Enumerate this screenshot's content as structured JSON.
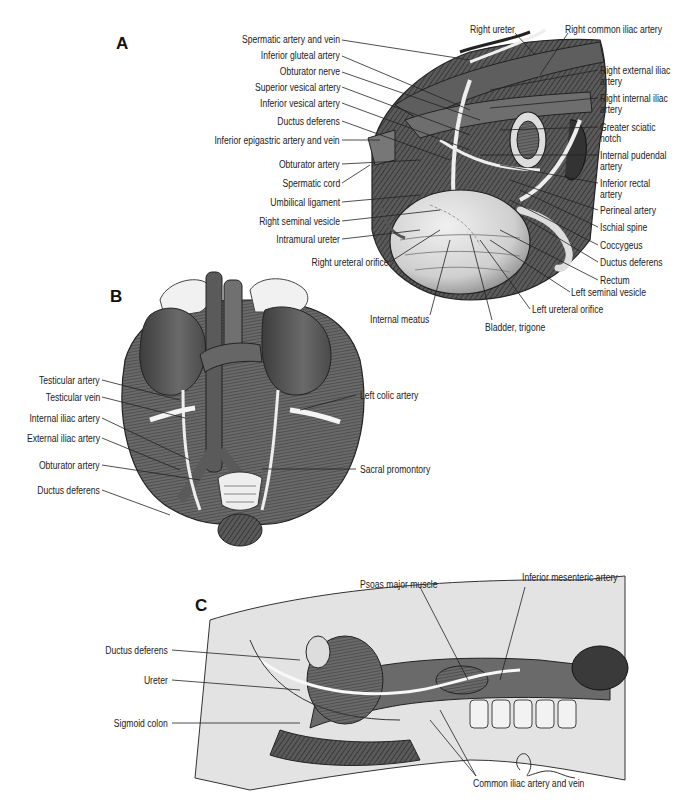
{
  "figure": {
    "panels": [
      {
        "letter": "A",
        "left_labels": [
          "Spermatic artery and vein",
          "Inferior gluteal artery",
          "Obturator nerve",
          "Superior vesical artery",
          "Inferior vesical artery",
          "Ductus deferens",
          "Inferior epigastric artery and vein",
          "Obturator artery",
          "Spermatic cord",
          "Umbilical ligament",
          "Right seminal vesicle",
          "Intramural ureter",
          "Right ureteral orifice"
        ],
        "top_labels": [
          "Right ureter",
          "Right common iliac artery"
        ],
        "right_labels": [
          "Right external iliac artery",
          "Right internal iliac artery",
          "Greater sciatic notch",
          "Internal pudendal artery",
          "Inferior rectal artery",
          "Perineal artery",
          "Ischial spine",
          "Coccygeus",
          "Ductus deferens",
          "Rectum",
          "Left seminal vesicle",
          "Left ureteral orifice",
          "Bladder, trigone",
          "Internal meatus"
        ]
      },
      {
        "letter": "B",
        "left_labels": [
          "Testicular artery",
          "Testicular vein",
          "Internal iliac artery",
          "External iliac artery",
          "Obturator artery",
          "Ductus deferens"
        ],
        "right_labels": [
          "Left colic artery",
          "Sacral promontory"
        ]
      },
      {
        "letter": "C",
        "left_labels": [
          "Ductus deferens",
          "Ureter",
          "Sigmoid colon"
        ],
        "top_labels": [
          "Psoas major muscle",
          "Inferior mesenteric artery"
        ],
        "bottom_labels": [
          "Common iliac artery and vein"
        ]
      }
    ],
    "colors": {
      "tissue_dark": "#4a4a4a",
      "tissue_mid": "#8a8a8a",
      "tissue_light": "#c8c8c8",
      "bladder": "#d9d9d9",
      "fat": "#eeeeee",
      "background_body": "#e4e4e4",
      "leader_line": "#222222"
    }
  }
}
